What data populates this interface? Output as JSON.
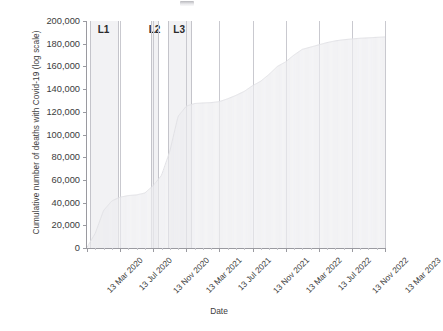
{
  "chart_data": {
    "type": "area",
    "title": "",
    "xlabel": "Date",
    "ylabel": "Cumulative number of deaths with Covid-19 (log scale)",
    "ylim": [
      0,
      200000
    ],
    "yticks": [
      0,
      20000,
      40000,
      60000,
      80000,
      100000,
      120000,
      140000,
      160000,
      180000,
      200000
    ],
    "ytick_labels": [
      "0",
      "20,000",
      "40,000",
      "60,000",
      "80,000",
      "100,000",
      "120,000",
      "140,000",
      "160,000",
      "180,000",
      "200,000"
    ],
    "xtick_labels": [
      "13 Mar 2020",
      "13 Jul 2020",
      "13 Nov 2020",
      "13 Mar 2021",
      "13 Jul 2021",
      "13 Nov 2021",
      "13 Mar 2022",
      "13 Jul 2022",
      "13 Nov 2022",
      "13 Mar 2023"
    ],
    "grid": "vertical",
    "legend": "none",
    "series": [
      {
        "name": "Cumulative deaths with Covid-19",
        "x": [
          "13 Mar 2020",
          "13 Apr 2020",
          "13 May 2020",
          "13 Jun 2020",
          "13 Jul 2020",
          "13 Aug 2020",
          "13 Sep 2020",
          "13 Oct 2020",
          "13 Nov 2020",
          "13 Dec 2020",
          "13 Jan 2021",
          "13 Feb 2021",
          "13 Mar 2021",
          "13 Apr 2021",
          "13 May 2021",
          "13 Jun 2021",
          "13 Jul 2021",
          "13 Aug 2021",
          "13 Sep 2021",
          "13 Oct 2021",
          "13 Nov 2021",
          "13 Dec 2021",
          "13 Jan 2022",
          "13 Feb 2022",
          "13 Mar 2022",
          "13 Apr 2022",
          "13 May 2022",
          "13 Jun 2022",
          "13 Jul 2022",
          "13 Aug 2022",
          "13 Sep 2022",
          "13 Oct 2022",
          "13 Nov 2022",
          "13 Dec 2022",
          "13 Jan 2023",
          "13 Feb 2023",
          "13 Mar 2023"
        ],
        "values": [
          500,
          13000,
          33000,
          41500,
          44800,
          46200,
          46800,
          48500,
          55000,
          64000,
          85000,
          116000,
          125000,
          127300,
          127800,
          128100,
          129000,
          131500,
          134500,
          138000,
          143000,
          147000,
          153000,
          160000,
          164000,
          170000,
          175000,
          177000,
          179000,
          181000,
          182500,
          183500,
          184200,
          184800,
          185200,
          185600,
          186000
        ]
      }
    ],
    "annotations": [
      {
        "label": "L1",
        "type": "lockdown-band",
        "start": "23 Mar 2020",
        "end": "04 Jul 2020"
      },
      {
        "label": "L2",
        "type": "lockdown-band",
        "start": "05 Nov 2020",
        "end": "02 Dec 2020"
      },
      {
        "label": "L3",
        "type": "lockdown-band",
        "start": "06 Jan 2021",
        "end": "29 Mar 2021"
      }
    ]
  },
  "axis": {
    "x_title": "Date",
    "y_title": "Cumulative number of deaths with Covid-19 (log scale)"
  },
  "colors": {
    "series_fill": "#ededf0",
    "band_fill": "#f2f2f4",
    "gridline": "#c9c9cf",
    "axis": "#9a9aa0",
    "text": "#3c3c3c"
  }
}
